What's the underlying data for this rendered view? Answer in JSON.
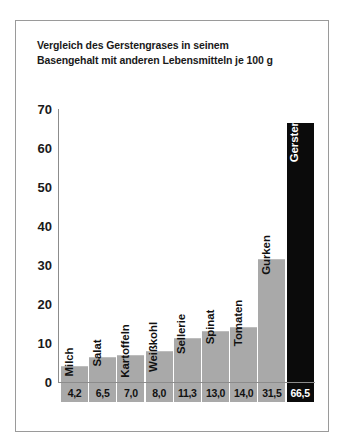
{
  "chart_data": {
    "type": "bar",
    "title": "Vergleich des Gerstengrases in seinem Basengehalt mit anderen Lebensmitteln je 100 g",
    "title_lines": [
      "Vergleich des Gerstengrases in seinem",
      "Basengehalt mit anderen Lebensmitteln je 100 g"
    ],
    "xlabel": "",
    "ylabel": "",
    "ylim": [
      0,
      70
    ],
    "yticks": [
      0,
      10,
      20,
      30,
      40,
      50,
      60,
      70
    ],
    "grid": false,
    "legend": "none",
    "categories": [
      "Milch",
      "Salat",
      "Kartoffeln",
      "Weißkohl",
      "Sellerie",
      "Spinat",
      "Tomaten",
      "Gurken",
      "Gerstengras"
    ],
    "values": [
      4.2,
      6.5,
      7.0,
      8.0,
      11.3,
      13.0,
      14.0,
      31.5,
      66.5
    ],
    "value_labels": [
      "4,2",
      "6,5",
      "7,0",
      "8,0",
      "11,3",
      "13,0",
      "14,0",
      "31,5",
      "66,5"
    ],
    "highlight_index": 8,
    "colors": {
      "bar": "#a9a9a9",
      "highlight_bar": "#0b0b0b",
      "axis": "#8c8c8c",
      "text": "#111111",
      "highlight_text": "#ffffff",
      "background": "#ffffff",
      "border": "#9a9a9a"
    }
  }
}
